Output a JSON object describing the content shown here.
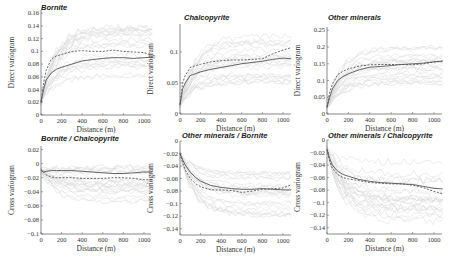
{
  "figure": {
    "layout": "2x3 grid of variogram panels",
    "legend": {
      "solid_line": "experimental/mean variogram (solid dark gray)",
      "dashed_line": "model/alternative variogram (dashed dark gray)",
      "background_lines": "individual realizations (light gray)"
    }
  },
  "chart_data": [
    {
      "type": "line",
      "title": "Bornite",
      "xlabel": "Distance (m)",
      "ylabel": "Direct variogram",
      "xlim": [
        0,
        1080
      ],
      "ylim": [
        0,
        0.165
      ],
      "xticks": [
        0,
        200,
        400,
        600,
        800,
        1000
      ],
      "yticks": [
        0,
        0.02,
        0.04,
        0.06,
        0.08,
        0.1,
        0.12,
        0.14,
        0.16
      ],
      "ytick_labels": [
        "0",
        "0.02",
        "0.04",
        "0.06",
        "0.08",
        "0.1",
        "0.12",
        "0.14",
        "0.16"
      ],
      "x": [
        0,
        25,
        50,
        100,
        150,
        200,
        300,
        400,
        500,
        600,
        700,
        800,
        900,
        1000,
        1080
      ],
      "series": [
        {
          "name": "solid",
          "style": "solid",
          "values": [
            0.02,
            0.04,
            0.055,
            0.066,
            0.072,
            0.075,
            0.08,
            0.085,
            0.087,
            0.089,
            0.09,
            0.09,
            0.089,
            0.09,
            0.091
          ]
        },
        {
          "name": "dashed",
          "style": "dashed",
          "values": [
            0.02,
            0.05,
            0.07,
            0.088,
            0.093,
            0.095,
            0.1,
            0.101,
            0.1,
            0.1,
            0.102,
            0.1,
            0.099,
            0.098,
            0.094
          ]
        }
      ],
      "bg_band": {
        "low": 0.06,
        "high": 0.14
      }
    },
    {
      "type": "line",
      "title": "Chalcopyrite",
      "xlabel": "Distance (m)",
      "ylabel": "Direct variogram",
      "xlim": [
        0,
        1080
      ],
      "ylim": [
        0,
        0.145
      ],
      "xticks": [
        0,
        200,
        400,
        600,
        800,
        1000
      ],
      "yticks": [
        0,
        0.05,
        0.1
      ],
      "ytick_labels": [
        "0",
        "0.05",
        "0.1"
      ],
      "x": [
        0,
        25,
        50,
        100,
        150,
        200,
        300,
        400,
        500,
        600,
        700,
        800,
        900,
        1000,
        1080
      ],
      "series": [
        {
          "name": "solid",
          "style": "solid",
          "values": [
            0.015,
            0.04,
            0.05,
            0.062,
            0.065,
            0.068,
            0.072,
            0.075,
            0.078,
            0.081,
            0.083,
            0.085,
            0.088,
            0.09,
            0.089
          ]
        },
        {
          "name": "dashed",
          "style": "dashed",
          "values": [
            0.015,
            0.05,
            0.062,
            0.075,
            0.078,
            0.08,
            0.084,
            0.086,
            0.087,
            0.087,
            0.088,
            0.089,
            0.097,
            0.103,
            0.107
          ]
        }
      ],
      "bg_band": {
        "low": 0.05,
        "high": 0.13
      }
    },
    {
      "type": "line",
      "title": "Other minerals",
      "xlabel": "Distance (m)",
      "ylabel": "Direct variogram",
      "xlim": [
        0,
        1080
      ],
      "ylim": [
        0,
        0.26
      ],
      "xticks": [
        0,
        200,
        400,
        600,
        800,
        1000
      ],
      "yticks": [
        0,
        0.05,
        0.1,
        0.15,
        0.2,
        0.25
      ],
      "ytick_labels": [
        "0",
        "0.05",
        "0.1",
        "0.15",
        "0.2",
        "0.25"
      ],
      "x": [
        0,
        25,
        50,
        100,
        150,
        200,
        300,
        400,
        500,
        600,
        700,
        800,
        900,
        1000,
        1080
      ],
      "series": [
        {
          "name": "solid",
          "style": "solid",
          "values": [
            0.02,
            0.05,
            0.075,
            0.1,
            0.112,
            0.12,
            0.132,
            0.14,
            0.142,
            0.145,
            0.148,
            0.15,
            0.152,
            0.156,
            0.158
          ]
        },
        {
          "name": "dashed",
          "style": "dashed",
          "values": [
            0.02,
            0.065,
            0.09,
            0.118,
            0.128,
            0.135,
            0.143,
            0.147,
            0.148,
            0.148,
            0.148,
            0.147,
            0.15,
            0.155,
            0.158
          ]
        }
      ],
      "bg_band": {
        "low": 0.09,
        "high": 0.21
      }
    },
    {
      "type": "line",
      "title": "Bornite / Chalcopyrite",
      "xlabel": "Distance (m)",
      "ylabel": "Cross variogram",
      "xlim": [
        0,
        1080
      ],
      "ylim": [
        -0.1,
        0.025
      ],
      "xticks": [
        0,
        200,
        400,
        600,
        800,
        1000
      ],
      "yticks": [
        -0.1,
        -0.08,
        -0.06,
        -0.04,
        -0.02,
        0,
        0.02
      ],
      "ytick_labels": [
        "−0.1",
        "−0.08",
        "−0.06",
        "−0.04",
        "−0.02",
        "0",
        "0.02"
      ],
      "x": [
        0,
        25,
        50,
        100,
        150,
        200,
        300,
        400,
        500,
        600,
        700,
        800,
        900,
        1000,
        1080
      ],
      "series": [
        {
          "name": "solid",
          "style": "solid",
          "values": [
            -0.01,
            -0.012,
            -0.011,
            -0.01,
            -0.01,
            -0.01,
            -0.01,
            -0.011,
            -0.012,
            -0.013,
            -0.014,
            -0.014,
            -0.013,
            -0.012,
            -0.012
          ]
        },
        {
          "name": "dashed",
          "style": "dashed",
          "values": [
            -0.008,
            -0.012,
            -0.016,
            -0.019,
            -0.02,
            -0.02,
            -0.02,
            -0.021,
            -0.021,
            -0.021,
            -0.02,
            -0.02,
            -0.021,
            -0.023,
            -0.023
          ]
        }
      ],
      "bg_band": {
        "low": -0.06,
        "high": 0.01
      }
    },
    {
      "type": "line",
      "title": "Other minerals / Bornite",
      "xlabel": "Distance (m)",
      "ylabel": "Cross variogram",
      "xlim": [
        0,
        1080
      ],
      "ylim": [
        -0.15,
        0.0
      ],
      "xticks": [
        0,
        200,
        400,
        600,
        800,
        1000
      ],
      "yticks": [
        -0.14,
        -0.12,
        -0.1,
        -0.08,
        -0.06,
        -0.04,
        -0.02,
        0
      ],
      "ytick_labels": [
        "−0.14",
        "−0.12",
        "−0.1",
        "−0.08",
        "−0.06",
        "−0.04",
        "−0.02",
        "0"
      ],
      "x": [
        0,
        25,
        50,
        100,
        150,
        200,
        300,
        400,
        500,
        600,
        700,
        800,
        900,
        1000,
        1080
      ],
      "series": [
        {
          "name": "solid",
          "style": "solid",
          "values": [
            -0.02,
            -0.03,
            -0.038,
            -0.05,
            -0.058,
            -0.064,
            -0.071,
            -0.074,
            -0.076,
            -0.077,
            -0.077,
            -0.076,
            -0.077,
            -0.078,
            -0.078
          ]
        },
        {
          "name": "dashed",
          "style": "dashed",
          "values": [
            -0.02,
            -0.035,
            -0.046,
            -0.06,
            -0.068,
            -0.073,
            -0.078,
            -0.078,
            -0.079,
            -0.082,
            -0.08,
            -0.077,
            -0.076,
            -0.075,
            -0.07
          ]
        }
      ],
      "bg_band": {
        "low": -0.12,
        "high": -0.05
      }
    },
    {
      "type": "line",
      "title": "Other minerals / Chalcopyrite",
      "xlabel": "Distance (m)",
      "ylabel": "Cross variogram",
      "xlim": [
        0,
        1080
      ],
      "ylim": [
        -0.15,
        0.0
      ],
      "xticks": [
        0,
        200,
        400,
        600,
        800,
        1000
      ],
      "yticks": [
        -0.14,
        -0.12,
        -0.1,
        -0.08,
        -0.06,
        -0.04,
        -0.02,
        0
      ],
      "ytick_labels": [
        "−0.14",
        "−0.12",
        "−0.1",
        "−0.08",
        "−0.06",
        "−0.04",
        "−0.02",
        "0"
      ],
      "x": [
        0,
        25,
        50,
        100,
        150,
        200,
        300,
        400,
        500,
        600,
        700,
        800,
        900,
        1000,
        1080
      ],
      "series": [
        {
          "name": "solid",
          "style": "solid",
          "values": [
            -0.015,
            -0.03,
            -0.04,
            -0.05,
            -0.055,
            -0.058,
            -0.063,
            -0.066,
            -0.068,
            -0.069,
            -0.07,
            -0.071,
            -0.074,
            -0.077,
            -0.078
          ]
        },
        {
          "name": "dashed",
          "style": "dashed",
          "values": [
            -0.015,
            -0.035,
            -0.045,
            -0.055,
            -0.06,
            -0.062,
            -0.065,
            -0.068,
            -0.069,
            -0.07,
            -0.07,
            -0.072,
            -0.076,
            -0.082,
            -0.086
          ]
        }
      ],
      "bg_band": {
        "low": -0.13,
        "high": -0.03
      }
    }
  ],
  "panels_geom": [
    {
      "x0": 41,
      "x1000": 144,
      "xend": 151,
      "ytop": 10,
      "ybot": 115,
      "title_x": 41,
      "title_y": 10
    },
    {
      "x0": 180,
      "x1000": 283,
      "xend": 291,
      "ytop": 24,
      "ybot": 114,
      "title_x": 184,
      "title_y": 20
    },
    {
      "x0": 327,
      "x1000": 434,
      "xend": 442,
      "ytop": 27,
      "ybot": 114,
      "title_x": 328,
      "title_y": 20
    },
    {
      "x0": 41,
      "x1000": 144,
      "xend": 151,
      "ytop": 146,
      "ybot": 234,
      "title_x": 41,
      "title_y": 141
    },
    {
      "x0": 180,
      "x1000": 283,
      "xend": 291,
      "ytop": 141,
      "ybot": 235,
      "title_x": 182,
      "title_y": 138
    },
    {
      "x0": 327,
      "x1000": 434,
      "xend": 442,
      "ytop": 140,
      "ybot": 234,
      "title_x": 328,
      "title_y": 138
    }
  ],
  "colors": {
    "axis": "#555555",
    "main_line": "#555555",
    "background_lines": "#d8d8d8",
    "text": "#333333"
  }
}
